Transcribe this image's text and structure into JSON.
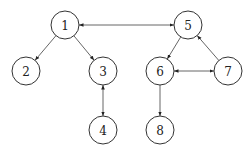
{
  "diagram": {
    "type": "directed-graph",
    "node_radius": 14,
    "colors": {
      "stroke": "#333333",
      "edge": "#555555",
      "fill": "#ffffff",
      "text": "#222222"
    },
    "nodes": [
      {
        "id": "1",
        "label": "1",
        "x": 65,
        "y": 25
      },
      {
        "id": "2",
        "label": "2",
        "x": 26,
        "y": 71
      },
      {
        "id": "3",
        "label": "3",
        "x": 103,
        "y": 71
      },
      {
        "id": "4",
        "label": "4",
        "x": 103,
        "y": 130
      },
      {
        "id": "5",
        "label": "5",
        "x": 188,
        "y": 25
      },
      {
        "id": "6",
        "label": "6",
        "x": 160,
        "y": 71
      },
      {
        "id": "7",
        "label": "7",
        "x": 228,
        "y": 71
      },
      {
        "id": "8",
        "label": "8",
        "x": 160,
        "y": 130
      }
    ],
    "edges": [
      {
        "from": "1",
        "to": "5",
        "bidirectional": true
      },
      {
        "from": "1",
        "to": "2",
        "bidirectional": false
      },
      {
        "from": "1",
        "to": "3",
        "bidirectional": false
      },
      {
        "from": "3",
        "to": "4",
        "bidirectional": true
      },
      {
        "from": "5",
        "to": "6",
        "bidirectional": false
      },
      {
        "from": "7",
        "to": "5",
        "bidirectional": false
      },
      {
        "from": "6",
        "to": "7",
        "bidirectional": true
      },
      {
        "from": "6",
        "to": "8",
        "bidirectional": false
      }
    ]
  }
}
